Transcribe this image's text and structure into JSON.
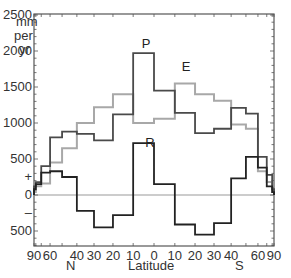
{
  "chart_data": {
    "type": "line",
    "style": "step",
    "title": "",
    "xlabel": "Latitude",
    "ylabel": "mm per yr",
    "ylim": [
      -700,
      2500
    ],
    "x_scale": "sine-latitude",
    "x_ticks": [
      "90",
      "60",
      "40",
      "30",
      "20",
      "10",
      "0",
      "10",
      "20",
      "30",
      "40",
      "60",
      "90"
    ],
    "x_hemisphere_labels": {
      "north": "N",
      "south": "S"
    },
    "y_ticks": [
      {
        "value": 2500,
        "label": "2500"
      },
      {
        "value": 2000,
        "label": "2000"
      },
      {
        "value": 1500,
        "label": "1500"
      },
      {
        "value": 1000,
        "label": "1000"
      },
      {
        "value": 500,
        "label": "500"
      },
      {
        "value": 250,
        "label": "+"
      },
      {
        "value": 0,
        "label": "0"
      },
      {
        "value": -250,
        "label": "–"
      },
      {
        "value": -500,
        "label": "500"
      }
    ],
    "unit_label": [
      "mm",
      "per",
      "yr"
    ],
    "bands": [
      "90-80N",
      "80-70N",
      "70-60N",
      "60-50N",
      "50-40N",
      "40-30N",
      "30-20N",
      "20-10N",
      "10-0N",
      "0-10S",
      "10-20S",
      "20-30S",
      "30-40S",
      "40-50S",
      "50-60S",
      "60-70S",
      "70-80S",
      "80-90S"
    ],
    "series": [
      {
        "name": "P",
        "label": "P",
        "color": "#4a4a4a",
        "values": [
          120,
          180,
          400,
          800,
          880,
          850,
          760,
          1120,
          1970,
          1450,
          1140,
          860,
          920,
          1210,
          1130,
          530,
          280,
          80
        ]
      },
      {
        "name": "E",
        "label": "E",
        "color": "#a8a8a8",
        "values": [
          40,
          120,
          160,
          450,
          650,
          1000,
          1220,
          1400,
          1000,
          1060,
          1550,
          1400,
          1310,
          980,
          920,
          330,
          180,
          40
        ]
      },
      {
        "name": "R",
        "label": "R",
        "color": "#222222",
        "values": [
          80,
          150,
          310,
          330,
          250,
          -220,
          -450,
          -280,
          720,
          150,
          -410,
          -550,
          -390,
          230,
          530,
          380,
          120,
          40
        ]
      }
    ],
    "grid": false,
    "legend": "inline labels"
  }
}
